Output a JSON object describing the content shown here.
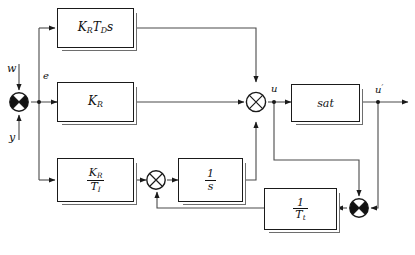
{
  "figure": {
    "line_color": "#4a4a4a",
    "stroke_color": "#1a1a1a",
    "shadow_color": "#6e6e6e",
    "background": "#ffffff"
  },
  "signals": {
    "setpoint": "w",
    "measurement": "y",
    "error": "e",
    "control": "u",
    "saturated_control": "u"
  },
  "blocks": {
    "derivative": {
      "name": "derivative-block",
      "gain": "K",
      "gain_sub": "R",
      "time": "T",
      "time_sub": "D",
      "operator": "s"
    },
    "proportional": {
      "name": "proportional-block",
      "gain": "K",
      "gain_sub": "R"
    },
    "integral_gain": {
      "name": "integral-gain-block",
      "num": "K",
      "num_sub": "R",
      "den": "T",
      "den_sub": "I"
    },
    "integrator": {
      "name": "integrator-block",
      "num": "1",
      "den": "s"
    },
    "saturation": {
      "name": "saturation-block",
      "label": "sat"
    },
    "tracking": {
      "name": "tracking-gain-block",
      "num": "1",
      "den": "T",
      "den_sub": "t"
    }
  },
  "junctions": {
    "error_sum": "error-summing-junction",
    "integrator_sum": "integrator-summing-junction",
    "control_sum": "control-summing-junction",
    "windup_sum": "windup-summing-junction"
  }
}
